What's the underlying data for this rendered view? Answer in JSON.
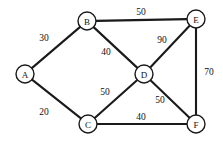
{
  "figure": {
    "type": "undirected-weighted-graph",
    "width": 223,
    "height": 141,
    "background_color": "#ffffff",
    "line_color": "#1a1a1a",
    "node_fill_color": "#ffffff",
    "text_color": "#111111"
  },
  "chart_data": {
    "type": "diagram",
    "title": "",
    "graph_kind": "undirected weighted graph",
    "node_radius": 9,
    "nodes": [
      {
        "id": "A",
        "label": "A",
        "x": 25,
        "y": 74
      },
      {
        "id": "B",
        "label": "B",
        "x": 87,
        "y": 21
      },
      {
        "id": "C",
        "label": "C",
        "x": 88,
        "y": 124
      },
      {
        "id": "D",
        "label": "D",
        "x": 144,
        "y": 74
      },
      {
        "id": "E",
        "label": "E",
        "x": 196,
        "y": 19
      },
      {
        "id": "F",
        "label": "F",
        "x": 196,
        "y": 124
      }
    ],
    "edges": [
      {
        "from": "A",
        "to": "B",
        "weight": 30,
        "label": "30",
        "label_x": 44,
        "label_y": 38
      },
      {
        "from": "A",
        "to": "C",
        "weight": 20,
        "label": "20",
        "label_x": 44,
        "label_y": 112
      },
      {
        "from": "B",
        "to": "E",
        "weight": 50,
        "label": "50",
        "label_x": 141,
        "label_y": 12
      },
      {
        "from": "B",
        "to": "D",
        "weight": 40,
        "label": "40",
        "label_x": 106,
        "label_y": 52
      },
      {
        "from": "D",
        "to": "E",
        "weight": 90,
        "label": "90",
        "label_x": 162,
        "label_y": 40
      },
      {
        "from": "E",
        "to": "F",
        "weight": 70,
        "label": "70",
        "label_x": 209,
        "label_y": 72
      },
      {
        "from": "C",
        "to": "D",
        "weight": 50,
        "label": "50",
        "label_x": 105,
        "label_y": 92
      },
      {
        "from": "D",
        "to": "F",
        "weight": 50,
        "label": "50",
        "label_x": 160,
        "label_y": 100
      },
      {
        "from": "C",
        "to": "F",
        "weight": 40,
        "label": "40",
        "label_x": 141,
        "label_y": 117
      }
    ]
  }
}
